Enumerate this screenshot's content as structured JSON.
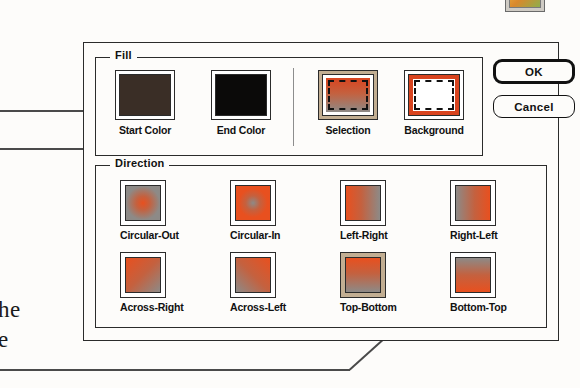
{
  "dialog": {
    "fill_group": {
      "legend": "Fill",
      "swatches": [
        {
          "name": "start-color",
          "label": "Start Color",
          "kind": "solid",
          "color": "#3a2e26",
          "frame": "white"
        },
        {
          "name": "end-color",
          "label": "End Color",
          "kind": "solid",
          "color": "#0b0a09",
          "frame": "white"
        },
        {
          "name": "selection",
          "label": "Selection",
          "kind": "marquee-gradient",
          "color": "#d9441f",
          "frame": "tan"
        },
        {
          "name": "background",
          "label": "Background",
          "kind": "marquee-inverse",
          "color": "#d9441f",
          "frame": "white"
        }
      ]
    },
    "direction_group": {
      "legend": "Direction",
      "selected": "Top-Bottom",
      "options": [
        {
          "label": "Circular-Out",
          "gradient": "radial-out",
          "selected": false
        },
        {
          "label": "Circular-In",
          "gradient": "radial-in",
          "selected": false
        },
        {
          "label": "Left-Right",
          "gradient": "left-right",
          "selected": false
        },
        {
          "label": "Right-Left",
          "gradient": "right-left",
          "selected": false
        },
        {
          "label": "Across-Right",
          "gradient": "across-right",
          "selected": false
        },
        {
          "label": "Across-Left",
          "gradient": "across-left",
          "selected": false
        },
        {
          "label": "Top-Bottom",
          "gradient": "top-bottom",
          "selected": true
        },
        {
          "label": "Bottom-Top",
          "gradient": "bottom-top",
          "selected": false
        }
      ]
    },
    "buttons": {
      "ok": "OK",
      "cancel": "Cancel"
    }
  },
  "page_text": {
    "fragment_1": "he",
    "fragment_2": "e"
  },
  "colors": {
    "accent_orange": "#d9441f",
    "gradient_gray": "#8d8a87",
    "start_color": "#3a2e26",
    "end_color": "#0b0a09",
    "selected_frame": "#c2ae92",
    "dialog_border": "#2b2b2b",
    "page_background": "#fdfcfa"
  },
  "corner_icon": {
    "name": "palette-thumbnail-icon"
  }
}
